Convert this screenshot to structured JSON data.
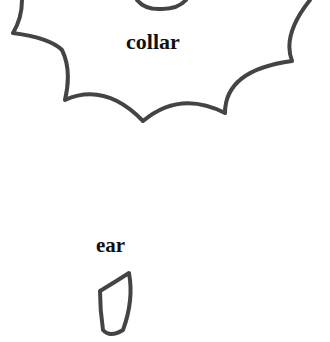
{
  "diagram": {
    "stroke_color": "#444444",
    "background": "#ffffff",
    "parts": [
      {
        "id": "collar",
        "label": "collar"
      },
      {
        "id": "ear",
        "label": "ear"
      }
    ]
  }
}
